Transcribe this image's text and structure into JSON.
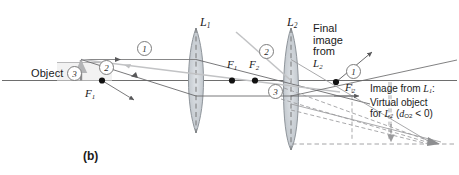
{
  "figure": {
    "panel_label": "(b)",
    "type": "two-lens ray diagram",
    "object_label": "Object",
    "lens1_label": "L",
    "lens1_sub": "1",
    "lens2_label": "L",
    "lens2_sub": "2",
    "focal_points": [
      {
        "name": "F",
        "sub": "1",
        "position": "left of L1"
      },
      {
        "name": "F",
        "sub": "1",
        "position": "right of L1"
      },
      {
        "name": "F",
        "sub": "2",
        "position": "left of L2"
      },
      {
        "name": "F",
        "sub": "2",
        "position": "right of L2"
      }
    ],
    "ray_numbers": [
      "1",
      "2",
      "3",
      "2",
      "3",
      "1"
    ],
    "annotations": {
      "final_image": [
        "Final",
        "image",
        "from",
        "L"
      ],
      "final_image_sub": "2",
      "virtual_object_line1_a": "Image from ",
      "virtual_object_line1_b": "L",
      "virtual_object_line1_sub": "1",
      "virtual_object_line1_c": ":",
      "virtual_object_line2": "Virtual object",
      "virtual_object_line3_a": "for ",
      "virtual_object_line3_b": "L",
      "virtual_object_line3_sub": "2",
      "virtual_object_line3_c": " (",
      "virtual_object_line3_d": "d",
      "virtual_object_line3_dsub": "O",
      "virtual_object_line3_dsub2": "2",
      "virtual_object_line3_e": " < 0)"
    },
    "colors": {
      "axis": "#6e6e6e",
      "ray_dark": "#58585a",
      "ray_light": "#bfc0c2",
      "lens_fill": "#c8cdd2",
      "lens_stroke": "#8f959b",
      "dashed": "#9a9a9c",
      "dot": "#111111",
      "text": "#1a1a1a",
      "background": "#ffffff"
    }
  }
}
